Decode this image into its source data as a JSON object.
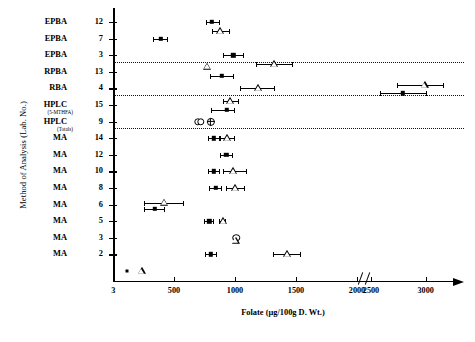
{
  "chart_data": {
    "type": "scatter",
    "title": "",
    "xlabel": "Folate (µg/100g D. Wt.)",
    "ylabel": "Method of Analysis (Lab. No.)",
    "xlim": [
      0,
      3250
    ],
    "xticks": [
      {
        "value": 0,
        "label": "3"
      },
      {
        "value": 500,
        "label": "500"
      },
      {
        "value": 1000,
        "label": "1000"
      },
      {
        "value": 1500,
        "label": "1500"
      },
      {
        "value": 2000,
        "label": "2000"
      },
      {
        "value": 2500,
        "label": "2500"
      },
      {
        "value": 3000,
        "label": "3000"
      }
    ],
    "axis_break": {
      "after": 2000,
      "before": 2500
    },
    "grid": false,
    "legend": "none",
    "marker_types": {
      "square": "filled-square",
      "triangle": "open-triangle",
      "circle": "open-circle",
      "circle_cross": "crossed-circle"
    },
    "categories": [
      {
        "method": "EPBA",
        "lab": "12",
        "sub": ""
      },
      {
        "method": "EPBA",
        "lab": "7",
        "sub": ""
      },
      {
        "method": "EPBA",
        "lab": "3",
        "sub": ""
      },
      {
        "method": "RPBA",
        "lab": "13",
        "sub": ""
      },
      {
        "method": "RBA",
        "lab": "4",
        "sub": ""
      },
      {
        "method": "HPLC",
        "lab": "15",
        "sub": "(5-MTHFA)"
      },
      {
        "method": "HPLC",
        "lab": "9",
        "sub": "(Totals)"
      },
      {
        "method": "MA",
        "lab": "14",
        "sub": ""
      },
      {
        "method": "MA",
        "lab": "12",
        "sub": ""
      },
      {
        "method": "MA",
        "lab": "10",
        "sub": ""
      },
      {
        "method": "MA",
        "lab": "8",
        "sub": ""
      },
      {
        "method": "MA",
        "lab": "6",
        "sub": ""
      },
      {
        "method": "MA",
        "lab": "5",
        "sub": ""
      },
      {
        "method": "MA",
        "lab": "3",
        "sub": ""
      },
      {
        "method": "MA",
        "lab": "2",
        "sub": ""
      }
    ],
    "separators_after_row": [
      2,
      4,
      6
    ],
    "points": [
      {
        "row": 0,
        "marker": "square",
        "x": 810,
        "lo": 760,
        "hi": 875
      },
      {
        "row": 0,
        "marker": "triangle",
        "x": 880,
        "lo": 810,
        "hi": 960,
        "dy": 9
      },
      {
        "row": 1,
        "marker": "square",
        "x": 390,
        "lo": 330,
        "hi": 450
      },
      {
        "row": 2,
        "marker": "square",
        "x": 985,
        "lo": 905,
        "hi": 1075
      },
      {
        "row": 2,
        "marker": "triangle",
        "x": 1320,
        "lo": 1175,
        "hi": 1475,
        "dy": 9
      },
      {
        "row": 3,
        "marker": "triangle",
        "x": 770,
        "lo": 770,
        "hi": 770,
        "dy": -5
      },
      {
        "row": 3,
        "marker": "square",
        "x": 890,
        "lo": 795,
        "hi": 990,
        "dy": 4
      },
      {
        "row": 4,
        "marker": "triangle",
        "x": 1190,
        "lo": 1045,
        "hi": 1330
      },
      {
        "row": 4,
        "marker": "square",
        "x": 2790,
        "lo": 2580,
        "hi": 3010,
        "dy": 5
      },
      {
        "row": 4,
        "marker": "triangle",
        "x": 2990,
        "lo": 2740,
        "hi": 3170,
        "dy": -3
      },
      {
        "row": 5,
        "marker": "triangle",
        "x": 960,
        "lo": 900,
        "hi": 1030,
        "dy": -4
      },
      {
        "row": 5,
        "marker": "square",
        "x": 935,
        "lo": 800,
        "hi": 1000,
        "dy": 5
      },
      {
        "row": 6,
        "marker": "circle",
        "x": 695,
        "lo": 695,
        "hi": 695
      },
      {
        "row": 6,
        "marker": "circle",
        "x": 722,
        "lo": 722,
        "hi": 722
      },
      {
        "row": 6,
        "marker": "circle_cross",
        "x": 800,
        "lo": 800,
        "hi": 800
      },
      {
        "row": 7,
        "marker": "square",
        "x": 825,
        "lo": 775,
        "hi": 880
      },
      {
        "row": 7,
        "marker": "triangle",
        "x": 935,
        "lo": 880,
        "hi": 1000
      },
      {
        "row": 8,
        "marker": "square",
        "x": 930,
        "lo": 880,
        "hi": 985
      },
      {
        "row": 9,
        "marker": "square",
        "x": 825,
        "lo": 775,
        "hi": 880
      },
      {
        "row": 9,
        "marker": "triangle",
        "x": 985,
        "lo": 900,
        "hi": 1095
      },
      {
        "row": 10,
        "marker": "square",
        "x": 845,
        "lo": 790,
        "hi": 895
      },
      {
        "row": 10,
        "marker": "triangle",
        "x": 1000,
        "lo": 930,
        "hi": 1080
      },
      {
        "row": 11,
        "marker": "square",
        "x": 345,
        "lo": 255,
        "hi": 430,
        "dy": 4
      },
      {
        "row": 11,
        "marker": "triangle",
        "x": 420,
        "lo": 255,
        "hi": 585,
        "dy": -2
      },
      {
        "row": 12,
        "marker": "square",
        "x": 790,
        "lo": 745,
        "hi": 830
      },
      {
        "row": 12,
        "marker": "triangle",
        "x": 900,
        "lo": 870,
        "hi": 930
      },
      {
        "row": 13,
        "marker": "square",
        "x": 1000,
        "lo": 1000,
        "hi": 1000
      },
      {
        "row": 13,
        "marker": "circle",
        "x": 1010,
        "lo": 1010,
        "hi": 1010
      },
      {
        "row": 13,
        "marker": "triangle",
        "x": 1005,
        "lo": 1005,
        "hi": 1005,
        "dy": 3
      },
      {
        "row": 14,
        "marker": "square",
        "x": 800,
        "lo": 755,
        "hi": 850
      },
      {
        "row": 14,
        "marker": "triangle",
        "x": 1430,
        "lo": 1315,
        "hi": 1545
      },
      {
        "row": 15,
        "marker": "dot",
        "x": 115,
        "lo": 115,
        "hi": 115
      },
      {
        "row": 15,
        "marker": "triangle",
        "x": 235,
        "lo": 235,
        "hi": 235
      }
    ]
  }
}
